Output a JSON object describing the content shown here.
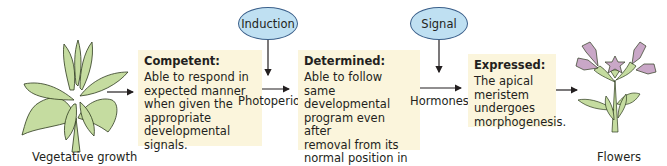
{
  "diagram": {
    "stages": [
      {
        "id": "vegetative",
        "label": "Vegetative growth"
      },
      {
        "id": "competent",
        "title": "Competent:",
        "body": "Able to respond in\nexpected manner\nwhen given the\nappropriate\ndevelopmental\nsignals."
      },
      {
        "id": "determined",
        "title": "Determined:",
        "body": "Able to follow same\ndevelopmental\nprogram even after\nremoval from its\nnormal position in\nplant."
      },
      {
        "id": "expressed",
        "title": "Expressed:",
        "body": "The apical\nmeristem\nundergoes\nmorphogenesis."
      },
      {
        "id": "flowers",
        "label": "Flowers"
      }
    ],
    "ovals": [
      {
        "id": "induction",
        "label": "Induction"
      },
      {
        "id": "signal",
        "label": "Signal"
      }
    ],
    "arrow_labels": [
      {
        "id": "photoperiod",
        "label": "Photoperiod"
      },
      {
        "id": "hormones",
        "label": "Hormones ?"
      }
    ],
    "colors": {
      "box_fill": "#fbf5dc",
      "oval_fill": "#bfe0f2",
      "oval_stroke": "#3a5f8a",
      "leaf_fill": "#c5dca0",
      "petal_fill": "#c9a7c7",
      "arrow": "#231f20"
    }
  }
}
